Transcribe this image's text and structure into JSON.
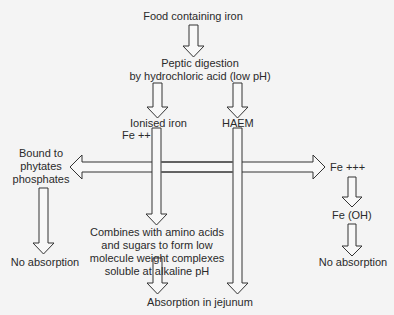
{
  "diagram": {
    "nodes": {
      "food": "Food containing iron",
      "peptic_1": "Peptic digestion",
      "peptic_2": "by hydrochloric acid (low pH)",
      "ionised": "Ionised iron",
      "fe2": "Fe  ++",
      "haem": "HAEM",
      "bound_1": "Bound to",
      "bound_2": "phytates",
      "bound_3": "phosphates",
      "fe3": "Fe  +++",
      "feoh": "Fe (OH)",
      "no_abs_left": "No absorption",
      "no_abs_right": "No absorption",
      "combines_1": "Combines with amino acids",
      "combines_2": "and sugars to form low",
      "combines_3": "molecule weight complexes",
      "combines_4": "soluble at alkaline pH",
      "jejunum": "Absorption in jejunum"
    },
    "edges": [
      {
        "from": "food",
        "to": "peptic"
      },
      {
        "from": "peptic",
        "to": "ionised"
      },
      {
        "from": "peptic",
        "to": "haem"
      },
      {
        "from": "fe2",
        "to": "bound",
        "bidirectional_with": "fe3"
      },
      {
        "from": "fe2",
        "to": "combines"
      },
      {
        "from": "bound",
        "to": "no_abs_left"
      },
      {
        "from": "fe3",
        "to": "feoh"
      },
      {
        "from": "feoh",
        "to": "no_abs_right"
      },
      {
        "from": "combines",
        "to": "jejunum"
      },
      {
        "from": "haem",
        "to": "jejunum"
      }
    ]
  }
}
